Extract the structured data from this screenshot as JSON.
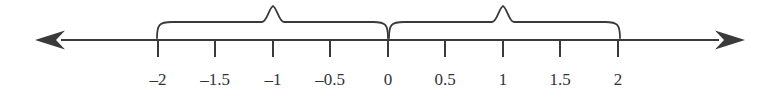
{
  "figure": {
    "background_color": "#ffffff",
    "ink_color": "#3a3a3a",
    "label_color": "#333333"
  },
  "axis": {
    "name": "number-line",
    "y": 40,
    "start_x": 35,
    "end_x": 745,
    "left_arrow": "arrow-left",
    "right_arrow": "arrow-right",
    "stroke_width": 2.2
  },
  "ticks": [
    {
      "value": -2,
      "label": "–2",
      "x": 158
    },
    {
      "value": -1.5,
      "label": "–1.5",
      "x": 215
    },
    {
      "value": -1,
      "label": "–1",
      "x": 273
    },
    {
      "value": -0.5,
      "label": "–0.5",
      "x": 330
    },
    {
      "value": 0,
      "label": "0",
      "x": 388
    },
    {
      "value": 0.5,
      "label": "0.5",
      "x": 445
    },
    {
      "value": 1,
      "label": "1",
      "x": 503
    },
    {
      "value": 1.5,
      "label": "1.5",
      "x": 560
    },
    {
      "value": 2,
      "label": "2",
      "x": 618
    }
  ],
  "tick_geometry": {
    "top_y": 40,
    "bottom_y": 57,
    "label_baseline_y": 71,
    "stroke_width": 2.0
  },
  "braces": [
    {
      "name": "brace-negative",
      "from_value": -2,
      "to_value": 0,
      "peak_value": -1,
      "left_x": 157,
      "right_x": 388,
      "peak_x": 273,
      "bar_y": 22,
      "peak_y": 6,
      "tip_y": 38
    },
    {
      "name": "brace-positive",
      "from_value": 0,
      "to_value": 2,
      "peak_value": 1,
      "left_x": 389,
      "right_x": 620,
      "peak_x": 503,
      "bar_y": 22,
      "peak_y": 6,
      "tip_y": 38
    }
  ],
  "chart_data": {
    "type": "line",
    "title": "",
    "xlabel": "",
    "ylabel": "",
    "xlim": [
      -2.4,
      2.4
    ],
    "grid": false,
    "legend": null,
    "categories": [
      "-2",
      "-1.5",
      "-1",
      "-0.5",
      "0",
      "0.5",
      "1",
      "1.5",
      "2"
    ],
    "values": [
      -2,
      -1.5,
      -1,
      -0.5,
      0,
      0.5,
      1,
      1.5,
      2
    ],
    "tick_labels": [
      "–2",
      "–1.5",
      "–1",
      "–0.5",
      "0",
      "0.5",
      "1",
      "1.5",
      "2"
    ],
    "annotations": [
      {
        "type": "brace",
        "span": [
          -2,
          0
        ],
        "peak": -1,
        "text": ""
      },
      {
        "type": "brace",
        "span": [
          0,
          2
        ],
        "peak": 1,
        "text": ""
      }
    ]
  }
}
